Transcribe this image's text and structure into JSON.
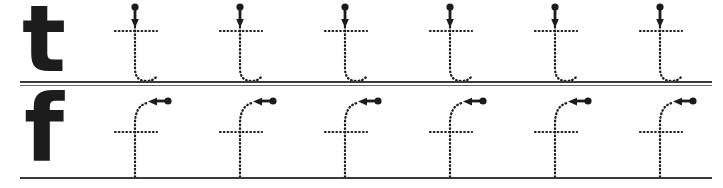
{
  "worksheet": {
    "title": "Lowercase letter tracing practice worksheet",
    "background_color": "#ffffff",
    "ink_color": "#1c1c1c",
    "rule_color": "#3a3a3a",
    "width": 723,
    "height": 188,
    "rows": [
      {
        "id": "row-t",
        "letter": "t",
        "model_letter": "t",
        "model_label": "t",
        "tracing_count": 6,
        "stroke_style": "dotted",
        "arrow_direction": "down",
        "arrow_start_marker": "round-dot",
        "arrow_end_marker": "arrowhead",
        "baseline_style": "double-rule",
        "guide_x_positions": [
          135,
          240,
          345,
          450,
          555,
          660
        ],
        "baseline_y": 82,
        "parts": [
          "vertical-stem",
          "horizontal-crossbar",
          "bottom-hook"
        ]
      },
      {
        "id": "row-f",
        "letter": "f",
        "model_letter": "f",
        "model_label": "f",
        "tracing_count": 6,
        "stroke_style": "dotted",
        "arrow_direction": "left",
        "arrow_start_marker": "round-dot",
        "arrow_end_marker": "arrowhead",
        "baseline_style": "single-rule",
        "guide_x_positions": [
          135,
          240,
          345,
          450,
          555,
          660
        ],
        "baseline_y": 177,
        "parts": [
          "top-hook",
          "vertical-stem",
          "horizontal-crossbar"
        ]
      }
    ]
  }
}
